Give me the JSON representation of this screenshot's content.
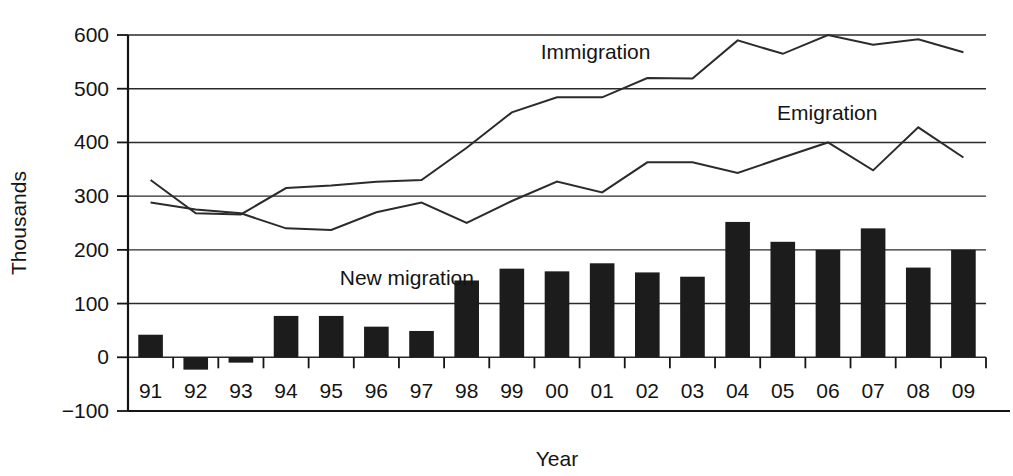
{
  "chart_data": {
    "type": "bar",
    "title": "",
    "subtitle": "",
    "xlabel": "Year",
    "ylabel": "Thousands",
    "categories": [
      "91",
      "92",
      "93",
      "94",
      "95",
      "96",
      "97",
      "98",
      "99",
      "00",
      "01",
      "02",
      "03",
      "04",
      "05",
      "06",
      "07",
      "08",
      "09"
    ],
    "ylim": [
      -100,
      600
    ],
    "yticks": [
      -100,
      0,
      100,
      200,
      300,
      400,
      500,
      600
    ],
    "ytick_labels": [
      "−100",
      "0",
      "100",
      "200",
      "300",
      "400",
      "500",
      "600"
    ],
    "grid": true,
    "legend_position": "inline-annotations",
    "series": [
      {
        "name": "New migration",
        "type": "bar",
        "label_text": "New migration",
        "values": [
          42,
          -23,
          -10,
          77,
          77,
          57,
          49,
          143,
          165,
          160,
          175,
          158,
          150,
          252,
          215,
          200,
          240,
          167,
          200
        ]
      },
      {
        "name": "Immigration",
        "type": "line",
        "label_text": "Immigration",
        "values": [
          330,
          268,
          266,
          315,
          320,
          327,
          330,
          390,
          456,
          484,
          484,
          520,
          519,
          590,
          565,
          600,
          582,
          592,
          568
        ]
      },
      {
        "name": "Emigration",
        "type": "line",
        "label_text": "Emigration",
        "values": [
          288,
          275,
          268,
          240,
          237,
          270,
          288,
          250,
          291,
          327,
          307,
          363,
          363,
          343,
          372,
          400,
          348,
          428,
          372
        ]
      }
    ],
    "annotations": [
      {
        "name": "immigration-label",
        "text": "Immigration",
        "x_pct": 0.545,
        "y_value": 555
      },
      {
        "name": "emigration-label",
        "text": "Emigration",
        "x_pct": 0.815,
        "y_value": 442
      },
      {
        "name": "new-migration-label",
        "text": "New migration",
        "x_pct": 0.325,
        "y_value": 135
      }
    ],
    "colors": {
      "bar": "#1c1c1c",
      "line": "#2b2b2b",
      "grid": "#2a2a2a",
      "axis": "#141414",
      "background": "#ffffff"
    }
  }
}
